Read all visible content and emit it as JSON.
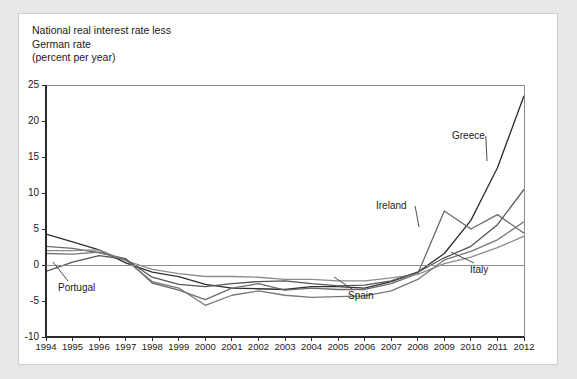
{
  "panel": {
    "background": "#ffffff",
    "border_color": "#cfcfcd",
    "page_background": "#e8e8e6"
  },
  "title": "National real interest rate less\nGerman rate\n(percent per year)",
  "chart_data": {
    "type": "line",
    "title": "National real interest rate less German rate (percent per year)",
    "subtitle": "",
    "xlabel": "",
    "ylabel": "percent per year",
    "grid": false,
    "legend_position": "inline-annotations",
    "xlim": [
      1994,
      2012
    ],
    "ylim": [
      -10,
      25
    ],
    "yticks": [
      -10,
      -5,
      0,
      5,
      10,
      15,
      20,
      25
    ],
    "ytick_labels": [
      "-10",
      "-5",
      "0",
      "5",
      "10",
      "15",
      "20",
      "25"
    ],
    "x": [
      1994,
      1995,
      1996,
      1997,
      1998,
      1999,
      2000,
      2001,
      2002,
      2003,
      2004,
      2005,
      2006,
      2007,
      2008,
      2009,
      2010,
      2011,
      2012
    ],
    "xtick_labels": [
      "1994",
      "1995",
      "1996",
      "1997",
      "1998",
      "1999",
      "2000",
      "2001",
      "2002",
      "2003",
      "2004",
      "2005",
      "2006",
      "2007",
      "2008",
      "2009",
      "2010",
      "2011",
      "2012"
    ],
    "zero_line": 0,
    "series": [
      {
        "name": "Greece",
        "color": "#2e2e2e",
        "width": 1.3,
        "values": [
          4.3,
          3.2,
          2.1,
          0.3,
          -1.0,
          -1.6,
          -2.7,
          -3.2,
          -3.3,
          -3.4,
          -3.0,
          -3.0,
          -3.2,
          -2.3,
          -1.0,
          1.6,
          6.2,
          13.5,
          23.5
        ]
      },
      {
        "name": "Ireland",
        "color": "#6a6a6a",
        "width": 1.3,
        "values": [
          2.6,
          2.3,
          1.7,
          0.9,
          -2.5,
          -3.5,
          -4.8,
          -3.2,
          -2.6,
          -3.5,
          -3.2,
          -3.4,
          -3.4,
          -2.6,
          -1.2,
          7.5,
          5.0,
          7.0,
          4.4
        ]
      },
      {
        "name": "Italy",
        "color": "#8c8c8c",
        "width": 1.3,
        "values": [
          2.0,
          2.0,
          2.1,
          0.6,
          -0.6,
          -1.2,
          -1.6,
          -1.6,
          -1.7,
          -2.0,
          -2.0,
          -2.2,
          -2.2,
          -1.8,
          -1.3,
          0.2,
          1.1,
          2.4,
          4.0
        ]
      },
      {
        "name": "Portugal",
        "color": "#555555",
        "width": 1.3,
        "values": [
          -0.9,
          0.4,
          1.3,
          0.8,
          -1.7,
          -2.7,
          -3.0,
          -2.6,
          -2.3,
          -2.2,
          -2.6,
          -2.9,
          -2.8,
          -2.2,
          -1.0,
          1.0,
          2.6,
          5.6,
          10.5
        ]
      },
      {
        "name": "Spain",
        "color": "#777777",
        "width": 1.3,
        "values": [
          1.6,
          1.5,
          1.8,
          0.7,
          -2.3,
          -3.2,
          -5.6,
          -4.2,
          -3.6,
          -4.2,
          -4.5,
          -4.4,
          -4.3,
          -3.6,
          -2.0,
          0.7,
          1.9,
          3.5,
          6.0
        ]
      }
    ],
    "annotations": [
      {
        "label": "Greece",
        "label_x": 452,
        "label_y": 136,
        "leader_to_x": 487,
        "leader_to_y": 161
      },
      {
        "label": "Ireland",
        "label_x": 376,
        "label_y": 206,
        "leader_to_x": 419,
        "leader_to_y": 227
      },
      {
        "label": "Italy",
        "label_x": 470,
        "label_y": 270,
        "leader_to_x": 451,
        "leader_to_y": 252
      },
      {
        "label": "Portugal",
        "label_x": 58,
        "label_y": 288,
        "leader_to_x": 53,
        "leader_to_y": 262
      },
      {
        "label": "Spain",
        "label_x": 348,
        "label_y": 296,
        "leader_to_x": 334,
        "leader_to_y": 277
      }
    ]
  }
}
